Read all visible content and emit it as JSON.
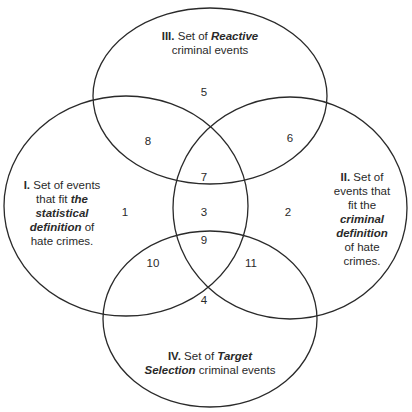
{
  "diagram": {
    "type": "venn",
    "stroke_color": "#2a2a2a",
    "sets": [
      {
        "id": "I",
        "numeral": "I.",
        "lines": [
          {
            "parts": [
              {
                "t": "I.",
                "s": "b"
              },
              {
                "t": " Set of events",
                "s": ""
              }
            ]
          },
          {
            "parts": [
              {
                "t": "that fit ",
                "s": ""
              },
              {
                "t": "the",
                "s": "bi"
              }
            ]
          },
          {
            "parts": [
              {
                "t": "statistical",
                "s": "bi"
              }
            ]
          },
          {
            "parts": [
              {
                "t": "definition",
                "s": "bi"
              },
              {
                "t": " of",
                "s": ""
              }
            ]
          },
          {
            "parts": [
              {
                "t": "hate crimes.",
                "s": ""
              }
            ]
          }
        ],
        "full_text": "I. Set of events that fit the statistical definition of hate crimes."
      },
      {
        "id": "II",
        "numeral": "II.",
        "lines": [
          {
            "parts": [
              {
                "t": "II.",
                "s": "b"
              },
              {
                "t": " Set of",
                "s": ""
              }
            ]
          },
          {
            "parts": [
              {
                "t": "events that",
                "s": ""
              }
            ]
          },
          {
            "parts": [
              {
                "t": "fit the",
                "s": ""
              }
            ]
          },
          {
            "parts": [
              {
                "t": "criminal",
                "s": "bi"
              }
            ]
          },
          {
            "parts": [
              {
                "t": "definition",
                "s": "bi"
              }
            ]
          },
          {
            "parts": [
              {
                "t": "of hate",
                "s": ""
              }
            ]
          },
          {
            "parts": [
              {
                "t": "crimes.",
                "s": ""
              }
            ]
          }
        ],
        "full_text": "II. Set of events that fit the criminal definition of hate crimes."
      },
      {
        "id": "III",
        "numeral": "III.",
        "lines": [
          {
            "parts": [
              {
                "t": "III.",
                "s": "b"
              },
              {
                "t": " Set of ",
                "s": ""
              },
              {
                "t": "Reactive",
                "s": "bi"
              }
            ]
          },
          {
            "parts": [
              {
                "t": "criminal events",
                "s": ""
              }
            ]
          }
        ],
        "full_text": "III. Set of Reactive criminal events"
      },
      {
        "id": "IV",
        "numeral": "IV.",
        "lines": [
          {
            "parts": [
              {
                "t": "IV.",
                "s": "b"
              },
              {
                "t": " Set of ",
                "s": ""
              },
              {
                "t": "Target",
                "s": "bi"
              }
            ]
          },
          {
            "parts": [
              {
                "t": "Selection",
                "s": "bi"
              },
              {
                "t": " criminal events",
                "s": ""
              }
            ]
          }
        ],
        "full_text": "IV. Set of Target Selection criminal events"
      }
    ],
    "regions": [
      {
        "label": "1",
        "x": 125,
        "y": 212
      },
      {
        "label": "2",
        "x": 288,
        "y": 212
      },
      {
        "label": "3",
        "x": 204,
        "y": 212
      },
      {
        "label": "4",
        "x": 204,
        "y": 300
      },
      {
        "label": "5",
        "x": 204,
        "y": 92
      },
      {
        "label": "6",
        "x": 290,
        "y": 138
      },
      {
        "label": "7",
        "x": 204,
        "y": 177
      },
      {
        "label": "8",
        "x": 148,
        "y": 141
      },
      {
        "label": "9",
        "x": 204,
        "y": 240
      },
      {
        "label": "10",
        "x": 153,
        "y": 263
      },
      {
        "label": "11",
        "x": 251,
        "y": 263
      }
    ]
  }
}
